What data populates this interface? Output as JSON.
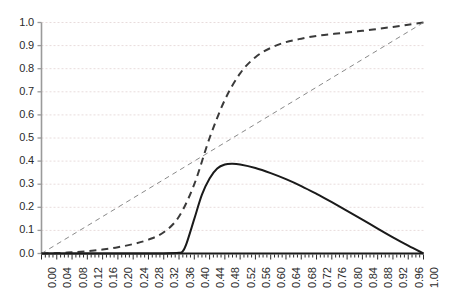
{
  "chart_data": {
    "type": "line",
    "title": "",
    "xlabel": "",
    "ylabel": "",
    "xlim": [
      0.0,
      1.0
    ],
    "ylim": [
      0.0,
      1.0
    ],
    "grid": true,
    "grid_axis": "y",
    "legend": "none",
    "xticks": [
      "0.00",
      "0.04",
      "0.08",
      "0.12",
      "0.16",
      "0.20",
      "0.24",
      "0.28",
      "0.32",
      "0.36",
      "0.40",
      "0.44",
      "0.48",
      "0.52",
      "0.56",
      "0.60",
      "0.64",
      "0.68",
      "0.72",
      "0.76",
      "0.80",
      "0.84",
      "0.88",
      "0.92",
      "0.96",
      "1.00"
    ],
    "xtick_values": [
      0.0,
      0.04,
      0.08,
      0.12,
      0.16,
      0.2,
      0.24,
      0.28,
      0.32,
      0.36,
      0.4,
      0.44,
      0.48,
      0.52,
      0.56,
      0.6,
      0.64,
      0.68,
      0.72,
      0.76,
      0.8,
      0.84,
      0.88,
      0.92,
      0.96,
      1.0
    ],
    "yticks": [
      "0.0",
      "0.1",
      "0.2",
      "0.3",
      "0.4",
      "0.5",
      "0.6",
      "0.7",
      "0.8",
      "0.9",
      "1.0"
    ],
    "ytick_values": [
      0.0,
      0.1,
      0.2,
      0.3,
      0.4,
      0.5,
      0.6,
      0.7,
      0.8,
      0.9,
      1.0
    ],
    "series": [
      {
        "name": "sigmoid-dashed-curve",
        "style": "dashed",
        "color": "#3a3a3a",
        "width": 2,
        "x": [
          0.0,
          0.04,
          0.08,
          0.12,
          0.16,
          0.2,
          0.24,
          0.28,
          0.32,
          0.36,
          0.4,
          0.44,
          0.48,
          0.52,
          0.56,
          0.6,
          0.64,
          0.68,
          0.72,
          0.76,
          0.8,
          0.84,
          0.88,
          0.92,
          0.96,
          1.0
        ],
        "values": [
          0.0,
          0.002,
          0.005,
          0.01,
          0.017,
          0.027,
          0.041,
          0.06,
          0.092,
          0.16,
          0.3,
          0.5,
          0.665,
          0.78,
          0.85,
          0.89,
          0.915,
          0.93,
          0.942,
          0.95,
          0.957,
          0.964,
          0.972,
          0.981,
          0.99,
          1.0
        ]
      },
      {
        "name": "diagonal-dashed-line",
        "style": "dashed",
        "color": "#8a8a8a",
        "width": 1,
        "x": [
          0.0,
          1.0
        ],
        "values": [
          0.0,
          1.0
        ]
      },
      {
        "name": "solid-peak-curve",
        "style": "solid",
        "color": "#1a1a1a",
        "width": 2,
        "x": [
          0.0,
          0.04,
          0.08,
          0.12,
          0.16,
          0.2,
          0.24,
          0.28,
          0.32,
          0.36,
          0.37,
          0.38,
          0.4,
          0.42,
          0.44,
          0.46,
          0.48,
          0.5,
          0.52,
          0.56,
          0.6,
          0.64,
          0.68,
          0.72,
          0.76,
          0.8,
          0.84,
          0.88,
          0.92,
          0.96,
          1.0
        ],
        "values": [
          0.0,
          0.0,
          0.0,
          0.0,
          0.0,
          0.0,
          0.0,
          0.0,
          0.0,
          0.003,
          0.01,
          0.045,
          0.15,
          0.255,
          0.325,
          0.368,
          0.385,
          0.388,
          0.385,
          0.37,
          0.348,
          0.322,
          0.292,
          0.258,
          0.222,
          0.185,
          0.147,
          0.108,
          0.07,
          0.034,
          0.0
        ]
      }
    ],
    "annotations": []
  },
  "axes": {
    "axis_color": "#9a9a9a",
    "gridline_color": "#e8dcdc",
    "tick_label_color": "#2b2b2b",
    "baseline_color": "#1a1a1a"
  }
}
